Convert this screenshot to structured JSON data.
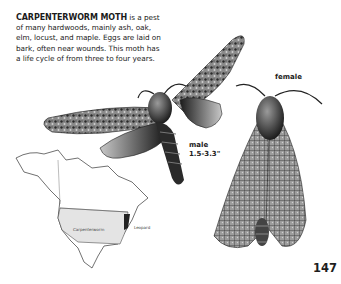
{
  "page": {
    "page_number": "147",
    "entry": {
      "title": "CARPENTERWORM MOTH",
      "body": " is a pest of many hardwoods, mainly ash, oak, elm, locust, and maple. Eggs are laid on bark, often near wounds. This moth has a life cycle of from three to four years."
    },
    "illustrations": {
      "male": {
        "label": "male",
        "size": "1.5-3.3\""
      },
      "female": {
        "label": "female"
      }
    },
    "range_map": {
      "region": "North America",
      "labels": [
        "Carpenterworm",
        "Leopard"
      ],
      "shade_color": "#e4e4e4"
    }
  }
}
